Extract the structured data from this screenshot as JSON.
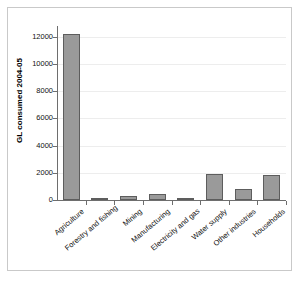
{
  "chart_data": {
    "type": "bar",
    "title": "",
    "subtitle": "",
    "xlabel": "",
    "ylabel": "GL consumed 2004-05",
    "ylim": [
      0,
      12800
    ],
    "yticks": [
      0,
      2000,
      4000,
      6000,
      8000,
      10000,
      12000
    ],
    "ytick_labels": [
      "0",
      "2000",
      "4000",
      "6000",
      "8000",
      "10000",
      "12000"
    ],
    "grid": true,
    "legend": false,
    "legend_position": "none",
    "categories": [
      "Agriculture",
      "Forestry and fishing",
      "Mining",
      "Manufacturing",
      "Electricity and gas",
      "Water supply",
      "Other industries",
      "Households"
    ],
    "values": [
      12200,
      60,
      280,
      440,
      110,
      1900,
      820,
      1850
    ],
    "series": [
      {
        "name": "GL consumed 2004-05",
        "values": [
          12200,
          60,
          280,
          440,
          110,
          1900,
          820,
          1850
        ]
      }
    ],
    "bar_color": "#9a9a9a",
    "bar_edge_color": "#5d5d5d",
    "axis_color": "#6e6e6e",
    "gridline_color": "#ededed",
    "frame_color": "#c9c9c9",
    "background": "#ffffff"
  }
}
